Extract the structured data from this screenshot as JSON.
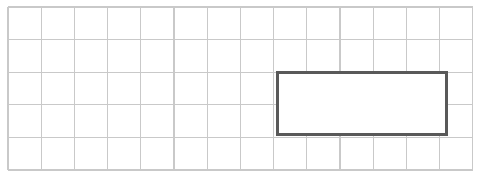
{
  "canvas": {
    "width": 484,
    "height": 177,
    "background_color": "#ffffff"
  },
  "grid": {
    "name": "square-grid",
    "columns": 14,
    "rows": 5,
    "cell_width": 33.2,
    "cell_height": 32.6,
    "origin_x": 8,
    "origin_y": 7,
    "line_color": "#c9c9c9",
    "line_width": 1.1,
    "fill_color": "#ffffff"
  },
  "shape": {
    "name": "rectangle",
    "type": "rectangle",
    "stroke_color": "#595959",
    "stroke_width": 3,
    "fill_color": "#ffffff",
    "x": 277,
    "y": 72,
    "width": 169,
    "height": 62,
    "grid_units_wide": 5,
    "grid_units_tall": 2,
    "start_column": 9,
    "start_row": 3
  },
  "chart_data": {
    "type": "table",
    "xlabel": "",
    "ylabel": "",
    "grid": true,
    "columns": [
      "property",
      "value"
    ],
    "rows": [
      [
        "grid columns",
        14
      ],
      [
        "grid rows",
        5
      ],
      [
        "rectangle width (squares)",
        5
      ],
      [
        "rectangle height (squares)",
        2
      ],
      [
        "rectangle area (squares)",
        10
      ],
      [
        "rectangle perimeter (squares)",
        14
      ]
    ]
  }
}
